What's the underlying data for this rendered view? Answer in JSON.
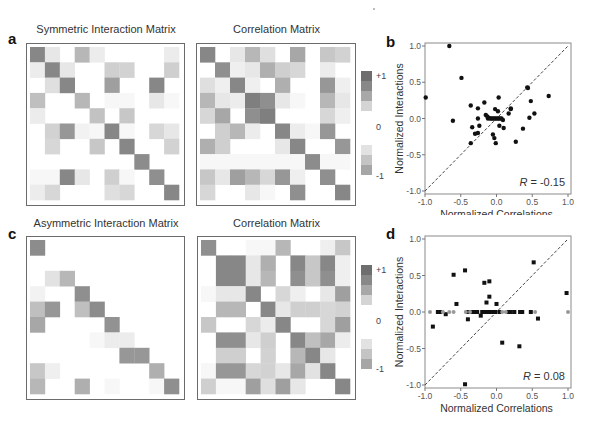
{
  "figure": {
    "panels": {
      "a": {
        "letter": "a",
        "left_title": "Symmetric Interaction Matrix",
        "right_title": "Correlation Matrix"
      },
      "b": {
        "letter": "b",
        "xlabel": "Normalized Correlations",
        "ylabel": "Normalized Interactions",
        "r_text": "R = -0.15",
        "r_symbol": "R",
        "r_value": " = -0.15"
      },
      "c": {
        "letter": "c",
        "left_title": "Asymmetric Interaction Matrix",
        "right_title": "Correlation Matrix"
      },
      "d": {
        "letter": "d",
        "xlabel": "Normalized Correlations",
        "ylabel": "Normalized Interactions",
        "r_text": "R = 0.08",
        "r_symbol": "R",
        "r_value": " = 0.08"
      }
    },
    "colorbar": {
      "top_label": "+1",
      "mid_label": "0",
      "bottom_label": "-1",
      "positive_colors": [
        "#6e6e6e",
        "#888888",
        "#a8a8a8",
        "#d4d4d4"
      ],
      "negative_colors": [
        "#e2e2e2",
        "#c4c4c4",
        "#a6a6a6"
      ]
    },
    "x_ticks": [
      "-1.0",
      "-0.5",
      "0.0",
      "0.5",
      "1.0"
    ],
    "y_ticks": [
      "1.0",
      "0.5",
      "0.0",
      "-0.5",
      "-1.0"
    ]
  },
  "chart_data": [
    {
      "type": "heatmap",
      "title": "Symmetric Interaction Matrix",
      "panel": "a-left",
      "size": [
        10,
        10
      ],
      "values": [
        [
          0.75,
          0.15,
          0,
          0.45,
          0.12,
          0,
          0,
          0,
          0,
          0.12
        ],
        [
          0.12,
          0.75,
          0.15,
          0,
          0,
          0.3,
          0.28,
          0,
          0,
          0.3
        ],
        [
          0,
          0.2,
          0.75,
          0,
          0,
          0.6,
          0,
          0,
          0.75,
          0
        ],
        [
          0.4,
          0,
          0,
          0.45,
          0,
          0.05,
          0.05,
          0,
          0.15,
          0.05
        ],
        [
          0.12,
          0,
          0,
          0,
          0.38,
          0,
          0.35,
          0,
          0,
          0
        ],
        [
          0,
          0.28,
          0.65,
          0.08,
          0.05,
          0.75,
          0.05,
          0,
          0.25,
          0.15
        ],
        [
          0,
          0.25,
          0,
          0,
          0.35,
          0,
          0.75,
          0,
          0,
          0.28
        ],
        [
          0,
          0,
          0,
          0,
          0,
          0,
          0,
          0.72,
          0,
          0
        ],
        [
          0.05,
          0.05,
          0.75,
          0.15,
          0,
          0.3,
          0.05,
          0,
          0.7,
          0
        ],
        [
          0.12,
          0.25,
          0,
          0,
          0,
          0.2,
          0.25,
          0,
          0,
          0.75
        ]
      ]
    },
    {
      "type": "heatmap",
      "title": "Correlation Matrix",
      "panel": "a-right",
      "size": [
        10,
        10
      ],
      "values": [
        [
          0.75,
          0,
          0.15,
          0.45,
          0.2,
          0,
          0.55,
          0,
          0.35,
          0.28
        ],
        [
          0,
          0.7,
          0.1,
          0.15,
          0.5,
          0.3,
          0.25,
          0,
          0.12,
          0
        ],
        [
          0.2,
          0.1,
          0.75,
          0.1,
          0,
          0.5,
          0,
          0,
          0.65,
          0.1
        ],
        [
          0.45,
          0.15,
          0.12,
          0.8,
          0.7,
          0.15,
          0.05,
          0,
          0.45,
          0.15
        ],
        [
          0.25,
          0.55,
          0,
          0.7,
          0.8,
          0,
          0,
          0,
          0.25,
          0.1
        ],
        [
          0,
          0.3,
          0.45,
          0.12,
          0,
          0.75,
          0.12,
          0.05,
          0.65,
          0
        ],
        [
          0.5,
          0.3,
          0,
          0,
          0,
          0.15,
          0.75,
          0,
          0,
          0.65
        ],
        [
          0.05,
          0.05,
          0.05,
          0.05,
          0.05,
          0.05,
          0.05,
          0.72,
          0.05,
          0.05
        ],
        [
          0.35,
          0.15,
          0.6,
          0.45,
          0.25,
          0.65,
          0.1,
          0,
          0.7,
          0
        ],
        [
          0.25,
          0,
          0,
          0.15,
          0.05,
          0,
          0.7,
          0,
          0,
          0.75
        ]
      ],
      "colorbar": {
        "min": -1,
        "max": 1,
        "ticks": [
          "+1",
          "0",
          "-1"
        ]
      }
    },
    {
      "type": "scatter",
      "panel": "b",
      "xlabel": "Normalized Correlations",
      "ylabel": "Normalized Interactions",
      "xlim": [
        -1,
        1
      ],
      "ylim": [
        -1,
        1
      ],
      "xticks": [
        -1.0,
        -0.5,
        0.0,
        0.5,
        1.0
      ],
      "yticks": [
        -1.0,
        -0.5,
        0.0,
        0.5,
        1.0
      ],
      "annotation": "R = -0.15",
      "reference_line": "y = x (dashed)",
      "points": [
        [
          -0.66,
          1.0
        ],
        [
          -0.49,
          0.56
        ],
        [
          -0.99,
          0.29
        ],
        [
          -0.61,
          -0.03
        ],
        [
          -0.36,
          0.18
        ],
        [
          -0.26,
          0.14
        ],
        [
          -0.17,
          0.22
        ],
        [
          0.03,
          0.29
        ],
        [
          -0.34,
          -0.12
        ],
        [
          -0.26,
          0.0
        ],
        [
          -0.24,
          -0.1
        ],
        [
          -0.3,
          -0.21
        ],
        [
          -0.26,
          -0.2
        ],
        [
          -0.36,
          -0.34
        ],
        [
          -0.05,
          -0.22
        ],
        [
          -0.03,
          -0.27
        ],
        [
          -0.01,
          -0.34
        ],
        [
          -0.02,
          0.13
        ],
        [
          0.02,
          0.1
        ],
        [
          0.04,
          -0.1
        ],
        [
          0.1,
          -0.13
        ],
        [
          0.17,
          0.07
        ],
        [
          0.2,
          0.13
        ],
        [
          0.2,
          0.14
        ],
        [
          0.43,
          0.43
        ],
        [
          0.44,
          0.42
        ],
        [
          0.48,
          0.24
        ],
        [
          0.46,
          0.01
        ],
        [
          0.53,
          0.07
        ],
        [
          0.37,
          -0.14
        ],
        [
          0.27,
          -0.32
        ],
        [
          0.73,
          0.31
        ],
        [
          -0.15,
          0.05
        ],
        [
          -0.13,
          0.03
        ],
        [
          -0.11,
          0.01
        ],
        [
          -0.09,
          0.0
        ],
        [
          -0.07,
          0.0
        ],
        [
          -0.05,
          0.0
        ],
        [
          -0.03,
          0.0
        ],
        [
          -0.01,
          0.0
        ],
        [
          0.01,
          0.0
        ],
        [
          0.03,
          0.0
        ],
        [
          0.05,
          0.0
        ],
        [
          0.07,
          0.0
        ],
        [
          0.09,
          -0.02
        ],
        [
          -0.12,
          0.0
        ]
      ]
    },
    {
      "type": "heatmap",
      "title": "Asymmetric Interaction Matrix",
      "panel": "c-left",
      "size": [
        10,
        10
      ],
      "values": [
        [
          0.72,
          0,
          0,
          0,
          0,
          0,
          0,
          0,
          0,
          0
        ],
        [
          0,
          0,
          0,
          0,
          0,
          0,
          0,
          0,
          0,
          0
        ],
        [
          0,
          0.18,
          0.45,
          0,
          0,
          0,
          0,
          0,
          0,
          0
        ],
        [
          0.08,
          0,
          0,
          0.7,
          0,
          0,
          0,
          0,
          0,
          0
        ],
        [
          0.4,
          0.65,
          0,
          0.4,
          0.72,
          0,
          0,
          0,
          0,
          0
        ],
        [
          0.55,
          0,
          0,
          0,
          0,
          0.68,
          0,
          0,
          0,
          0
        ],
        [
          0,
          0,
          0,
          0,
          0.05,
          0.12,
          0.12,
          0,
          0,
          0
        ],
        [
          0,
          0,
          0,
          0,
          0,
          0,
          0.65,
          0.65,
          0,
          0
        ],
        [
          0.35,
          0.1,
          0,
          0,
          0,
          0,
          0,
          0,
          0.5,
          0
        ],
        [
          0.45,
          0,
          0,
          0.5,
          0,
          0.05,
          0,
          0,
          0.05,
          0.7
        ]
      ]
    },
    {
      "type": "heatmap",
      "title": "Correlation Matrix",
      "panel": "c-right",
      "size": [
        10,
        10
      ],
      "values": [
        [
          0.7,
          0,
          0,
          0.05,
          0.05,
          0.45,
          0,
          0,
          0.1,
          0.35
        ],
        [
          0,
          0.75,
          0.75,
          0.15,
          0.5,
          0,
          0.75,
          0.35,
          0.75,
          0.1
        ],
        [
          0,
          0.75,
          0.75,
          0.15,
          0.45,
          0,
          0.7,
          0.35,
          0.7,
          0.1
        ],
        [
          0.05,
          0.15,
          0.15,
          0.75,
          0,
          0.25,
          0.1,
          0,
          0.15,
          0.6
        ],
        [
          0,
          0.45,
          0.45,
          0,
          0.75,
          0.15,
          0.3,
          0.3,
          0.25,
          0.28
        ],
        [
          0.35,
          0,
          0,
          0.25,
          0.12,
          0.75,
          0,
          0,
          0.25,
          0.6
        ],
        [
          0,
          0.7,
          0.7,
          0.15,
          0.3,
          0,
          0.75,
          0.4,
          0.55,
          0.12
        ],
        [
          0,
          0.3,
          0.3,
          0,
          0.28,
          0,
          0.45,
          0.75,
          0.15,
          0
        ],
        [
          0.05,
          0.65,
          0.65,
          0.25,
          0.28,
          0.15,
          0.55,
          0.18,
          0.75,
          0
        ],
        [
          0.3,
          0.05,
          0.05,
          0.6,
          0.2,
          0.6,
          0.15,
          0,
          0,
          0.75
        ]
      ],
      "colorbar": {
        "min": -1,
        "max": 1,
        "ticks": [
          "+1",
          "0",
          "-1"
        ]
      }
    },
    {
      "type": "scatter",
      "panel": "d",
      "xlabel": "Normalized Correlations",
      "ylabel": "Normalized Interactions",
      "xlim": [
        -1,
        1
      ],
      "ylim": [
        -1,
        1
      ],
      "xticks": [
        -1.0,
        -0.5,
        0.0,
        0.5,
        1.0
      ],
      "yticks": [
        -1.0,
        -0.5,
        0.0,
        0.5,
        1.0
      ],
      "annotation": "R = 0.08",
      "reference_line": "y = x (dashed)",
      "series": [
        {
          "name": "nonzero interactions (black squares)",
          "marker": "square",
          "color": "#111111",
          "points": [
            [
              -0.6,
              0.51
            ],
            [
              -0.44,
              0.57
            ],
            [
              -0.17,
              0.4
            ],
            [
              -0.1,
              0.42
            ],
            [
              -0.1,
              0.21
            ],
            [
              -0.14,
              0.13
            ],
            [
              0.0,
              0.11
            ],
            [
              -0.56,
              0.11
            ],
            [
              0.52,
              0.68
            ],
            [
              0.98,
              0.26
            ],
            [
              -0.89,
              -0.2
            ],
            [
              -0.4,
              -0.1
            ],
            [
              -0.22,
              -0.05
            ],
            [
              -0.71,
              -0.03
            ],
            [
              0.58,
              -0.09
            ],
            [
              0.08,
              -0.42
            ],
            [
              0.32,
              -0.47
            ],
            [
              -0.44,
              -0.99
            ],
            [
              -0.82,
              0
            ],
            [
              -0.79,
              0
            ],
            [
              -0.4,
              0
            ],
            [
              -0.34,
              0
            ],
            [
              -0.3,
              0
            ],
            [
              -0.27,
              0
            ],
            [
              -0.2,
              0
            ],
            [
              -0.17,
              0
            ],
            [
              -0.12,
              0
            ],
            [
              -0.1,
              0
            ],
            [
              -0.07,
              0
            ],
            [
              -0.04,
              0
            ],
            [
              -0.02,
              0
            ],
            [
              0.04,
              0
            ],
            [
              0.17,
              0
            ],
            [
              0.2,
              0
            ],
            [
              0.25,
              0
            ],
            [
              0.33,
              0
            ],
            [
              0.36,
              0
            ],
            [
              0.48,
              0
            ]
          ]
        },
        {
          "name": "zero interactions (gray dots)",
          "marker": "circle",
          "color": "#9a9a9a",
          "points": [
            [
              -0.93,
              0
            ],
            [
              -0.75,
              0
            ],
            [
              -0.66,
              0
            ],
            [
              -0.6,
              0
            ],
            [
              -0.43,
              0
            ],
            [
              -0.37,
              0
            ],
            [
              0.08,
              0
            ],
            [
              0.13,
              0
            ],
            [
              0.54,
              0
            ],
            [
              1.0,
              0
            ]
          ]
        }
      ]
    }
  ]
}
